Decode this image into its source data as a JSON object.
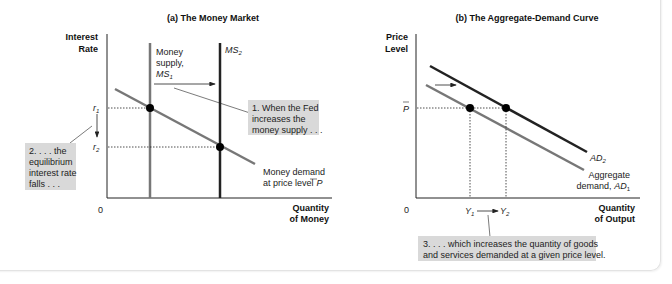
{
  "figure": {
    "panel_a": {
      "title": "(a) The Money Market",
      "y_axis_label_line1": "Interest",
      "y_axis_label_line2": "Rate",
      "x_axis_label_line1": "Quantity",
      "x_axis_label_line2": "of Money",
      "origin": "0",
      "r1_label": "r",
      "r1_sub": "1",
      "r2_label": "r",
      "r2_sub": "2",
      "ms1_label_line1": "Money",
      "ms1_label_line2": "supply,",
      "ms1_label_line3": "MS",
      "ms1_sub": "1",
      "ms2_label": "MS",
      "ms2_sub": "2",
      "md_label_line1": "Money demand",
      "md_label_line2": "at price level",
      "md_label_p": "P",
      "note1_line1": "1. When the Fed",
      "note1_line2": "increases the",
      "note1_line3": "money supply . . .",
      "note2_line1": "2. . . . the",
      "note2_line2": "equilibrium",
      "note2_line3": "interest rate",
      "note2_line4": "falls . . ."
    },
    "panel_b": {
      "title": "(b) The Aggregate-Demand Curve",
      "y_axis_label_line1": "Price",
      "y_axis_label_line2": "Level",
      "x_axis_label_line1": "Quantity",
      "x_axis_label_line2": "of Output",
      "origin": "0",
      "p_label": "P",
      "y1_label": "Y",
      "y1_sub": "1",
      "y2_label": "Y",
      "y2_sub": "2",
      "ad2_label": "AD",
      "ad2_sub": "2",
      "ad1_label_line1": "Aggregate",
      "ad1_label_line2": "demand,",
      "ad1_label_ad": "AD",
      "ad1_sub": "1",
      "note3_line1": "3. . . . which increases the quantity of goods",
      "note3_line2": "and services demanded at a given price level."
    },
    "colors": {
      "axis": "#222222",
      "curve_gray": "#777777",
      "curve_dark": "#222222",
      "note_bg": "#d9d9d9",
      "dot": "#000000"
    }
  }
}
